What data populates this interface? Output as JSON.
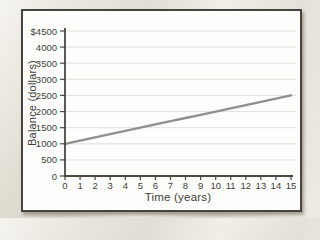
{
  "chart_data": {
    "type": "line",
    "title": "",
    "xlabel": "Time (years)",
    "ylabel": "Balance (dollars)",
    "x": [
      0,
      1,
      2,
      3,
      4,
      5,
      6,
      7,
      8,
      9,
      10,
      11,
      12,
      13,
      14,
      15
    ],
    "series": [
      {
        "name": "Balance",
        "values": [
          1000,
          1100,
          1200,
          1300,
          1400,
          1500,
          1600,
          1700,
          1800,
          1900,
          2000,
          2100,
          2200,
          2300,
          2400,
          2500
        ]
      }
    ],
    "xlim": [
      0,
      15
    ],
    "ylim": [
      0,
      4500
    ],
    "x_ticks": [
      0,
      1,
      2,
      3,
      4,
      5,
      6,
      7,
      8,
      9,
      10,
      11,
      12,
      13,
      14,
      15
    ],
    "y_ticks": [
      0,
      500,
      1000,
      1500,
      2000,
      2500,
      3000,
      3500,
      4000,
      4500
    ],
    "y_tick_labels": [
      "0",
      "500",
      "1000",
      "1500",
      "2000",
      "2500",
      "3000",
      "3500",
      "4000",
      "$4500"
    ],
    "grid": "horizontal",
    "legend": "none",
    "colors": {
      "line": "#8f9092",
      "axis": "#4a4841",
      "grid": "#e2e1dc",
      "text": "#413f38",
      "panel_background": "#fdfdfb",
      "panel_border": "#45443e",
      "page_background": "#e8e4da"
    }
  }
}
